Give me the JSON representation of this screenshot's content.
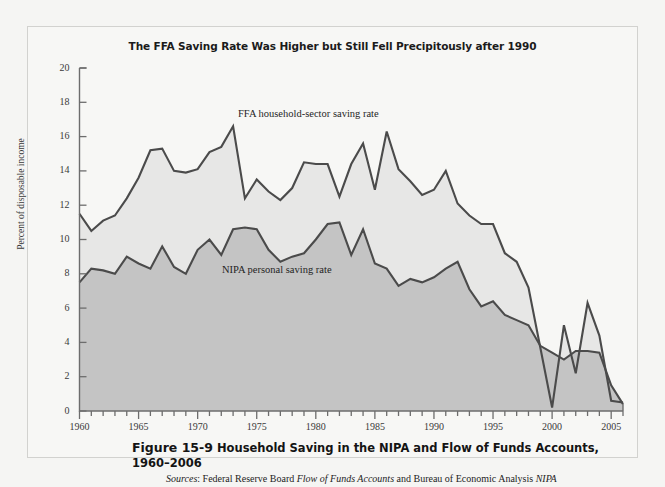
{
  "page": {
    "bg_color": "#f5f5f3",
    "frame_color": "#d2d2cf"
  },
  "chart_title": "The FFA Saving Rate Was Higher but Still Fell Precipitously after 1990",
  "axes": {
    "ylabel": "Percent of disposable income",
    "yticks": [
      "20",
      "18",
      "16",
      "14",
      "12",
      "10",
      "8",
      "6",
      "4",
      "2",
      "0"
    ],
    "xticks": [
      "1960",
      "1965",
      "1970",
      "1975",
      "1980",
      "1985",
      "1990",
      "1995",
      "2000",
      "2005"
    ]
  },
  "series_labels": {
    "ffa": "FFA household-sector saving rate",
    "nipa": "NIPA personal saving rate"
  },
  "caption": {
    "figure_number": "Figure 15-9",
    "text": "Household Saving in the NIPA and Flow of Funds Accounts, 1960–2006",
    "sources_prefix": "Sources",
    "sources_text_1": "Federal Reserve Board ",
    "sources_italic_1": "Flow of Funds Accounts",
    "sources_text_2": " and Bureau of Economic Analysis ",
    "sources_italic_2": "NIPA"
  },
  "colors": {
    "ffa_fill": "#e7e7e6",
    "nipa_fill": "#c4c4c4",
    "line": "#4b4b4b",
    "axis": "#6d6d6d",
    "text": "#2b2b2b"
  },
  "chart_data": {
    "type": "area",
    "title": "The FFA Saving Rate Was Higher but Still Fell Precipitously after 1990",
    "xlabel": "",
    "ylabel": "Percent of disposable income",
    "xlim": [
      1960,
      2006
    ],
    "ylim": [
      0,
      20
    ],
    "ytick_step": 2,
    "grid": false,
    "legend": "inline-annotations",
    "x": [
      1960,
      1961,
      1962,
      1963,
      1964,
      1965,
      1966,
      1967,
      1968,
      1969,
      1970,
      1971,
      1972,
      1973,
      1974,
      1975,
      1976,
      1977,
      1978,
      1979,
      1980,
      1981,
      1982,
      1983,
      1984,
      1985,
      1986,
      1987,
      1988,
      1989,
      1990,
      1991,
      1992,
      1993,
      1994,
      1995,
      1996,
      1997,
      1998,
      1999,
      2000,
      2001,
      2002,
      2003,
      2004,
      2005,
      2006
    ],
    "series": [
      {
        "name": "FFA household-sector saving rate",
        "fill": "#e7e7e6",
        "values": [
          11.5,
          10.5,
          11.1,
          11.4,
          12.4,
          13.6,
          15.2,
          15.3,
          14.0,
          13.9,
          14.1,
          15.1,
          15.4,
          16.6,
          12.4,
          13.5,
          12.8,
          12.3,
          13.0,
          14.5,
          14.4,
          14.4,
          12.5,
          14.4,
          15.6,
          12.9,
          16.3,
          14.1,
          13.4,
          12.6,
          12.9,
          14.0,
          12.1,
          11.4,
          10.9,
          10.9,
          9.2,
          8.7,
          7.2,
          3.7,
          0.2,
          5.0,
          2.2,
          6.3,
          4.4,
          0.6,
          0.5
        ]
      },
      {
        "name": "NIPA personal saving rate",
        "fill": "#c4c4c4",
        "values": [
          7.5,
          8.3,
          8.2,
          8.0,
          9.0,
          8.6,
          8.3,
          9.6,
          8.4,
          8.0,
          9.4,
          10.0,
          9.1,
          10.6,
          10.7,
          10.6,
          9.4,
          8.7,
          9.0,
          9.2,
          10.0,
          10.9,
          11.0,
          9.1,
          10.6,
          8.6,
          8.3,
          7.3,
          7.7,
          7.5,
          7.8,
          8.3,
          8.7,
          7.1,
          6.1,
          6.4,
          5.6,
          5.3,
          5.0,
          3.8,
          3.4,
          3.0,
          3.5,
          3.5,
          3.4,
          1.5,
          0.4
        ]
      }
    ]
  }
}
